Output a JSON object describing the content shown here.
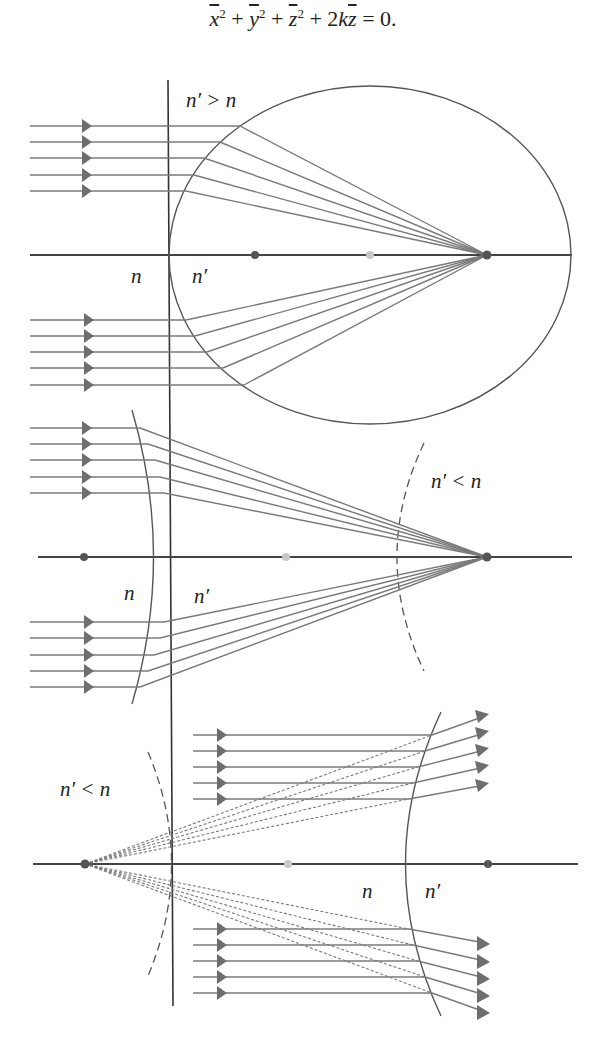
{
  "equation": {
    "display": "x̄² + ȳ² + z̄² + 2kz̄ = 0.",
    "terms": [
      {
        "var": "x",
        "overline": true,
        "exp": "2"
      },
      {
        "op": "+"
      },
      {
        "var": "y",
        "overline": true,
        "exp": "2"
      },
      {
        "op": "+"
      },
      {
        "var": "z",
        "overline": true,
        "exp": "2"
      },
      {
        "op": "+"
      },
      {
        "coef": "2",
        "var": "k"
      },
      {
        "var": "z",
        "overline": true
      },
      {
        "op": "= 0."
      }
    ]
  },
  "panels": [
    {
      "name": "convex-ellipse-converging",
      "condition_label": "n′ > n",
      "medium_left": "n",
      "medium_right": "n′",
      "surface": "ellipse (solid)",
      "rays": "5 parallel rays above + 5 below axis, refracted to focus",
      "axis_points": [
        "dark",
        "light",
        "dark-focus"
      ]
    },
    {
      "name": "concave-hyperbola-converging",
      "condition_label": "n′ < n",
      "medium_left": "n",
      "medium_right": "n′",
      "surface": "hyperbola (solid) with dashed conjugate branch",
      "rays": "5 parallel rays above + 5 below axis, refracted to focus",
      "axis_points": [
        "dark",
        "light",
        "dark-focus"
      ]
    },
    {
      "name": "diverging-hyperbola",
      "condition_label": "n′ < n",
      "medium_left": "n",
      "medium_right": "n′",
      "surface": "hyperbola (solid) with dashed conjugate branch",
      "rays": "5 parallel rays above + 5 below axis, refracted away from virtual focus (dashed extensions)",
      "axis_points": [
        "dark-virtual-focus",
        "light",
        "dark"
      ]
    }
  ],
  "labels": {
    "p1_cond": "n′ > n",
    "p1_n": "n",
    "p1_np": "n′",
    "p2_cond": "n′ < n",
    "p2_n": "n",
    "p2_np": "n′",
    "p3_cond": "n′ < n",
    "p3_n": "n",
    "p3_np": "n′"
  },
  "colors": {
    "ray": "#7a7a7a",
    "axis": "#444444",
    "surface": "#555555",
    "dot_dark": "#555555",
    "dot_light": "#c8c8c8",
    "arrow": "#6e6e6e"
  }
}
